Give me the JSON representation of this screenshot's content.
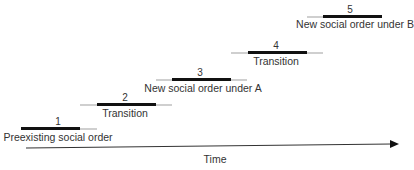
{
  "diagram": {
    "stages": [
      {
        "number": "1",
        "label": "Preexisting social order"
      },
      {
        "number": "2",
        "label": "Transition"
      },
      {
        "number": "3",
        "label": "New social order under A"
      },
      {
        "number": "4",
        "label": "Transition"
      },
      {
        "number": "5",
        "label": "New social order under B"
      }
    ],
    "axis_label": "Time",
    "colors": {
      "bar": "#111111",
      "overlap": "#cfcfcf",
      "axis": "#333333"
    }
  }
}
